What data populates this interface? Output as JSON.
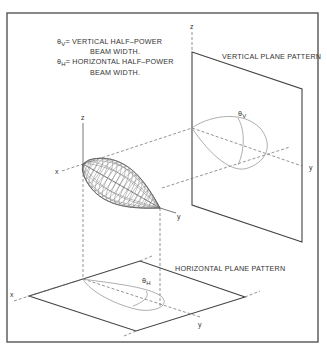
{
  "diagram": {
    "legend": {
      "line1_symbol": "θ",
      "line1_sub": "V",
      "line1_text": "= VERTICAL HALF–POWER",
      "line2_text": "BEAM WIDTH.",
      "line3_symbol": "θ",
      "line3_sub": "H",
      "line3_text": "= HORIZONTAL HALF–POWER",
      "line4_text": "BEAM WIDTH."
    },
    "labels": {
      "vertical_plane": "VERTICAL PLANE PATTERN",
      "horizontal_plane": "HORIZONTAL PLANE PATTERN",
      "theta_v_symbol": "θ",
      "theta_v_sub": "V",
      "theta_h_symbol": "θ",
      "theta_h_sub": "H"
    },
    "axes": {
      "x": "x",
      "y": "y",
      "z": "z"
    },
    "colors": {
      "line": "#444444",
      "lobe": "#999999",
      "background": "#ffffff"
    }
  }
}
